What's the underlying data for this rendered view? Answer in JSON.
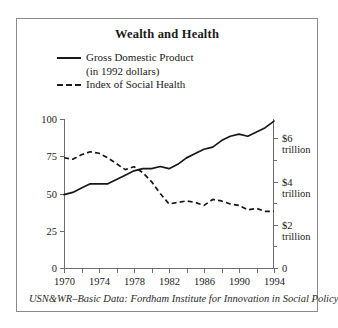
{
  "figure": {
    "title": "Wealth and Health",
    "source_note": "USN&WR–Basic Data: Fordham Institute for Innovation in Social Policy"
  },
  "legend": {
    "items": [
      {
        "label": "Gross Domestic Product",
        "sublabel": "(in 1992 dollars)",
        "style": "solid"
      },
      {
        "label": "Index of Social Health",
        "sublabel": "",
        "style": "dashed"
      }
    ]
  },
  "axes": {
    "left_ticks": [
      "0",
      "25",
      "50",
      "75",
      "100"
    ],
    "right_ticks": [
      "0",
      "$2",
      "$4",
      "$6"
    ],
    "right_unit": "trillion",
    "x_ticks": [
      "1970",
      "1974",
      "1978",
      "1982",
      "1986",
      "1990",
      "1994"
    ]
  },
  "chart_data": {
    "type": "line",
    "title": "Wealth and Health",
    "xlabel": "",
    "ylabel": "Index of Social Health",
    "y2label": "Gross Domestic Product (in 1992 dollars)",
    "xlim": [
      1970,
      1994
    ],
    "ylim": [
      0,
      100
    ],
    "y2lim": [
      0,
      6.9
    ],
    "grid": false,
    "legend_position": "top-left",
    "x": [
      1970,
      1971,
      1972,
      1973,
      1974,
      1975,
      1976,
      1977,
      1978,
      1979,
      1980,
      1981,
      1982,
      1983,
      1984,
      1985,
      1986,
      1987,
      1988,
      1989,
      1990,
      1991,
      1992,
      1993,
      1994
    ],
    "series": [
      {
        "name": "Gross Domestic Product",
        "unit": "trillions of 1992 dollars",
        "axis": "right",
        "style": "solid",
        "values": [
          3.4,
          3.5,
          3.7,
          3.9,
          3.9,
          3.9,
          4.1,
          4.3,
          4.5,
          4.6,
          4.6,
          4.7,
          4.6,
          4.8,
          5.1,
          5.3,
          5.5,
          5.6,
          5.9,
          6.1,
          6.2,
          6.1,
          6.3,
          6.5,
          6.8
        ]
      },
      {
        "name": "Index of Social Health",
        "unit": "index (0–100)",
        "axis": "left",
        "style": "dashed",
        "values": [
          74,
          73,
          76,
          78,
          77,
          74,
          70,
          66,
          68,
          64,
          58,
          50,
          43,
          44,
          45,
          44,
          42,
          46,
          45,
          43,
          42,
          39,
          40,
          38,
          38
        ]
      }
    ],
    "annotations": [
      "GDP rises steadily from 1970 to 1994 with flat spells around 1974–1975 and 1981–1982 and a pause near 1990–1991.",
      "Index of Social Health peaks near 1973 and falls sharply through 1982, then stays near 40–45."
    ]
  }
}
